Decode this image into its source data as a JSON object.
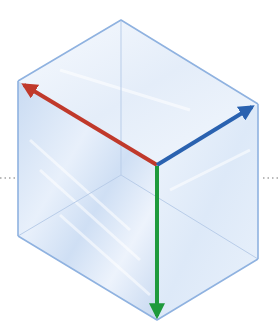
{
  "diagram": {
    "colors": {
      "edge": "#8fb2e0",
      "edge_hidden": "#b9cde9",
      "face_left": "#d3e2f5",
      "face_right": "#e6effa",
      "face_top": "#f4f8fd",
      "x_axis": "#c0392b",
      "y_axis": "#2a62b0",
      "z_axis": "#1e9a3c",
      "dots": "#777777"
    },
    "vertices": {
      "top": [
        121,
        20
      ],
      "left_top": [
        18,
        81
      ],
      "right_top": [
        258,
        104
      ],
      "front_top": [
        157,
        165
      ],
      "left_bottom": [
        18,
        236
      ],
      "right_bottom": [
        258,
        259
      ],
      "front_bottom": [
        157,
        320
      ],
      "back_bottom": [
        121,
        175
      ]
    },
    "arrows": [
      {
        "name": "red-arrow",
        "from": [
          157,
          165
        ],
        "to": [
          22,
          84
        ],
        "color": "#c0392b"
      },
      {
        "name": "blue-arrow",
        "from": [
          157,
          165
        ],
        "to": [
          254,
          106
        ],
        "color": "#2a62b0"
      },
      {
        "name": "green-arrow",
        "from": [
          157,
          165
        ],
        "to": [
          157,
          318
        ],
        "color": "#1e9a3c"
      }
    ],
    "dotted_guides": [
      {
        "from": [
          0,
          178
        ],
        "to": [
          16,
          178
        ]
      },
      {
        "from": [
          262,
          178
        ],
        "to": [
          278,
          178
        ]
      }
    ]
  }
}
